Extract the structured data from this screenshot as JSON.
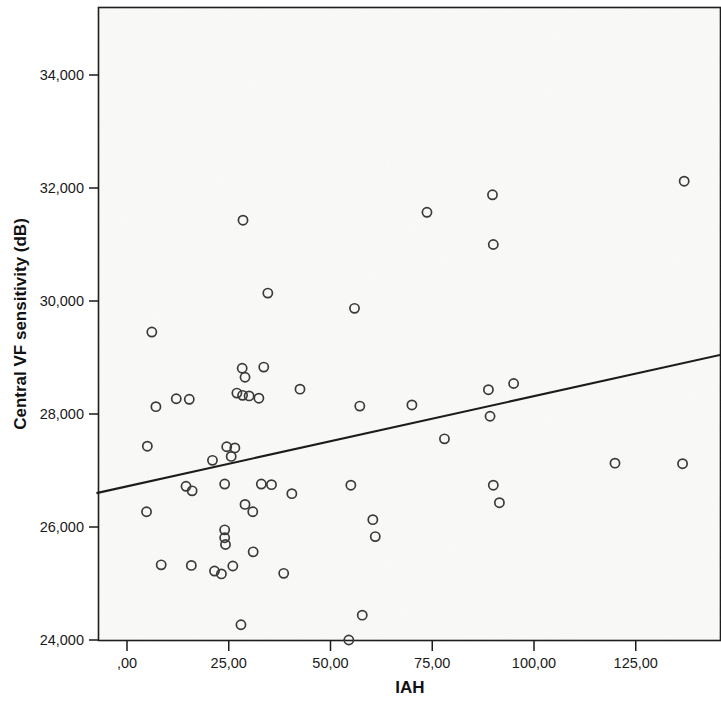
{
  "chart_data": {
    "type": "scatter",
    "title": "",
    "xlabel": "IAH",
    "ylabel": "Central VF sensitivity (dB)",
    "xlim": [
      -7.5,
      146
    ],
    "ylim": [
      24000,
      35600
    ],
    "grid": false,
    "legend": null,
    "x_ticks": [
      0,
      25,
      50,
      75,
      100,
      125
    ],
    "x_tick_labels": [
      ",00",
      "25,00",
      "50,00",
      "75,00",
      "100,00",
      "125,00"
    ],
    "y_ticks": [
      24000,
      26000,
      28000,
      30000,
      32000,
      34000
    ],
    "y_tick_labels": [
      "24,000",
      "26,000",
      "28,000",
      "30,000",
      "32,000",
      "34,000"
    ],
    "marker": {
      "shape": "circle-open",
      "color": "#3a3a3a",
      "size": 8
    },
    "fit_line": {
      "type": "linear-regression",
      "color": "#1c1c1c",
      "x_start": -7.5,
      "y_start": 26600,
      "x_end": 146,
      "y_end": 29050
    },
    "points": [
      {
        "x": 28.5,
        "y": 31430
      },
      {
        "x": 34.6,
        "y": 30140
      },
      {
        "x": 6.1,
        "y": 29450
      },
      {
        "x": 55.9,
        "y": 29870
      },
      {
        "x": 73.7,
        "y": 31570
      },
      {
        "x": 89.8,
        "y": 31880
      },
      {
        "x": 90.0,
        "y": 31000
      },
      {
        "x": 136.9,
        "y": 32120
      },
      {
        "x": 28.3,
        "y": 28810
      },
      {
        "x": 29.0,
        "y": 28650
      },
      {
        "x": 33.6,
        "y": 28830
      },
      {
        "x": 7.1,
        "y": 28130
      },
      {
        "x": 12.1,
        "y": 28270
      },
      {
        "x": 15.3,
        "y": 28260
      },
      {
        "x": 27.0,
        "y": 28370
      },
      {
        "x": 28.4,
        "y": 28330
      },
      {
        "x": 30.0,
        "y": 28320
      },
      {
        "x": 32.4,
        "y": 28280
      },
      {
        "x": 42.5,
        "y": 28440
      },
      {
        "x": 57.2,
        "y": 28140
      },
      {
        "x": 70.0,
        "y": 28160
      },
      {
        "x": 88.8,
        "y": 28430
      },
      {
        "x": 89.2,
        "y": 27960
      },
      {
        "x": 95.0,
        "y": 28540
      },
      {
        "x": 5.0,
        "y": 27430
      },
      {
        "x": 21.0,
        "y": 27180
      },
      {
        "x": 24.5,
        "y": 27420
      },
      {
        "x": 26.5,
        "y": 27400
      },
      {
        "x": 25.6,
        "y": 27250
      },
      {
        "x": 78.0,
        "y": 27560
      },
      {
        "x": 119.9,
        "y": 27130
      },
      {
        "x": 136.5,
        "y": 27120
      },
      {
        "x": 4.8,
        "y": 26270
      },
      {
        "x": 14.5,
        "y": 26720
      },
      {
        "x": 16.0,
        "y": 26640
      },
      {
        "x": 24.0,
        "y": 26760
      },
      {
        "x": 29.0,
        "y": 26400
      },
      {
        "x": 30.9,
        "y": 26270
      },
      {
        "x": 33.0,
        "y": 26760
      },
      {
        "x": 35.5,
        "y": 26750
      },
      {
        "x": 40.5,
        "y": 26590
      },
      {
        "x": 55.0,
        "y": 26740
      },
      {
        "x": 60.4,
        "y": 26130
      },
      {
        "x": 61.0,
        "y": 25830
      },
      {
        "x": 90.0,
        "y": 26740
      },
      {
        "x": 91.5,
        "y": 26430
      },
      {
        "x": 24.0,
        "y": 25950
      },
      {
        "x": 24.0,
        "y": 25810
      },
      {
        "x": 24.2,
        "y": 25690
      },
      {
        "x": 31.0,
        "y": 25560
      },
      {
        "x": 8.4,
        "y": 25330
      },
      {
        "x": 15.8,
        "y": 25320
      },
      {
        "x": 21.5,
        "y": 25220
      },
      {
        "x": 23.2,
        "y": 25170
      },
      {
        "x": 26.0,
        "y": 25310
      },
      {
        "x": 38.5,
        "y": 25180
      },
      {
        "x": 28.0,
        "y": 24270
      },
      {
        "x": 54.5,
        "y": 24000
      },
      {
        "x": 57.8,
        "y": 24440
      }
    ]
  }
}
